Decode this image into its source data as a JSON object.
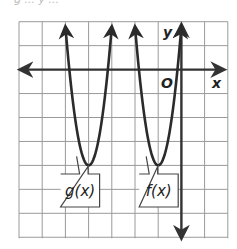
{
  "figure": {
    "top_clipped_text": "g ... y ...",
    "axes": {
      "x_label": "x",
      "y_label": "y",
      "origin_label": "O",
      "x_range": [
        -7,
        2
      ],
      "y_range": [
        -7,
        2
      ],
      "grid": true,
      "grid_step": 1
    },
    "curves": [
      {
        "id": "g",
        "label": "g(x)",
        "vertex": [
          -4,
          -4
        ],
        "a": 5.8,
        "opens": "up"
      },
      {
        "id": "f",
        "label": "f(x)",
        "vertex": [
          -1,
          -4
        ],
        "a": 5.8,
        "opens": "up"
      }
    ],
    "colors": {
      "grid": "#9a9a9a",
      "axis": "#333333",
      "curve": "#2b2b2b",
      "label_box_border": "#444444",
      "text": "#222222"
    }
  },
  "chart_data": {
    "type": "line",
    "title": "",
    "xlabel": "x",
    "ylabel": "y",
    "xlim": [
      -7,
      2
    ],
    "ylim": [
      -7,
      2
    ],
    "grid": true,
    "series": [
      {
        "name": "g(x)",
        "vertex": [
          -4,
          -4
        ],
        "equation": "g(x) = a(x+4)^2 - 4",
        "x": [
          -5.0,
          -4.5,
          -4.0,
          -3.5,
          -3.0
        ],
        "y": [
          1.8,
          -2.55,
          -4,
          -2.55,
          1.8
        ]
      },
      {
        "name": "f(x)",
        "vertex": [
          -1,
          -4
        ],
        "equation": "f(x) = a(x+1)^2 - 4",
        "x": [
          -2.0,
          -1.5,
          -1.0,
          -0.5,
          0.0
        ],
        "y": [
          1.8,
          -2.55,
          -4,
          -2.55,
          1.8
        ]
      }
    ],
    "annotations": [
      "O (origin)",
      "g(x) label box",
      "f(x) label box"
    ]
  }
}
